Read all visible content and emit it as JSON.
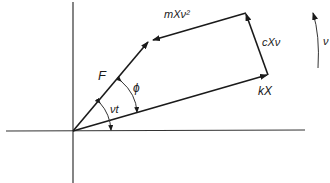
{
  "diagram": {
    "labels": {
      "force": "F",
      "phase_angle": "ϕ",
      "rotation_angle": "νt",
      "inertia_force": "mXν²",
      "damping_force": "cXν",
      "spring_force": "kX",
      "angular_velocity": "ν"
    },
    "vectors": [
      {
        "name": "spring-force",
        "label": "kX"
      },
      {
        "name": "damping-force",
        "label": "cXν"
      },
      {
        "name": "inertia-force",
        "label": "mXν²"
      },
      {
        "name": "applied-force",
        "label": "F"
      }
    ],
    "colors": {
      "ink": "#1a1a1a",
      "background": "#ffffff"
    }
  }
}
